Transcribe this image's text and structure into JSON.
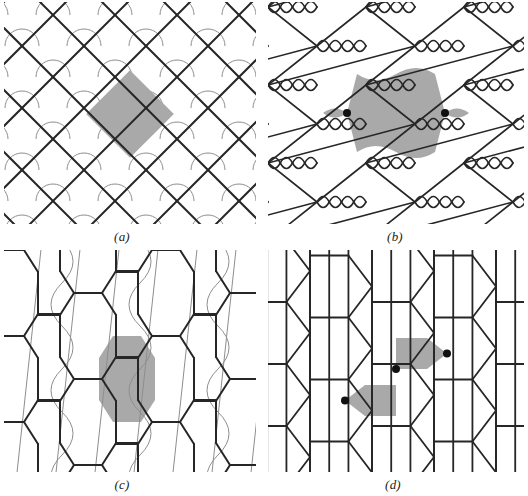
{
  "figure": {
    "type": "scientific-diagram",
    "background_color": "#ffffff",
    "line_color": "#262626",
    "thin_line_color": "#8e8e8e",
    "shade_color": "#a9a9a9",
    "dot_color": "#111111"
  },
  "panels": [
    {
      "id": "a",
      "label": "(a)",
      "pattern": "diagonal square lattice of crossing straight lines forming diamonds, with thin gray quarter-arcs at each crossing",
      "shaded_cell": "diamond (square rotated 45 degrees)",
      "dots": 0,
      "grid_spacing_px": 62,
      "line_width_px": 2.0,
      "arc_radius_px": 17
    },
    {
      "id": "b",
      "label": "(b)",
      "pattern": "hexagonal net whose horizontal edges are pairs of mirrored sine waves crossing to form lens shapes",
      "shaded_cell": "hexagon with wavy top and bottom edges plus two small lens lobes left and right",
      "dots": 2,
      "cell_width_px": 98,
      "cell_height_px": 78,
      "line_width_px": 1.6
    },
    {
      "id": "c",
      "label": "(c)",
      "pattern": "vertically elongated hexagonal honeycomb with short horizontal connectors, overlaid by thin gray slanted lines and S-curves",
      "shaded_cell": "flat-sided hexagon crossed by a thin slanted line and bounded by arcs",
      "dots": 0,
      "cell_width_px": 78,
      "cell_height_px": 86,
      "line_width_px": 2.0
    },
    {
      "id": "d",
      "label": "(d)",
      "pattern": "alternating columns of rectangular grid bars and vertical zigzag chevron strips",
      "shaded_cell": "two offset squares, each with an outward-pointing triangle",
      "dots": 3,
      "column_width_px": 62,
      "row_height_px": 31,
      "line_width_px": 1.8
    }
  ],
  "labels": {
    "a": "(a)",
    "b": "(b)",
    "c": "(c)",
    "d": "(d)"
  }
}
